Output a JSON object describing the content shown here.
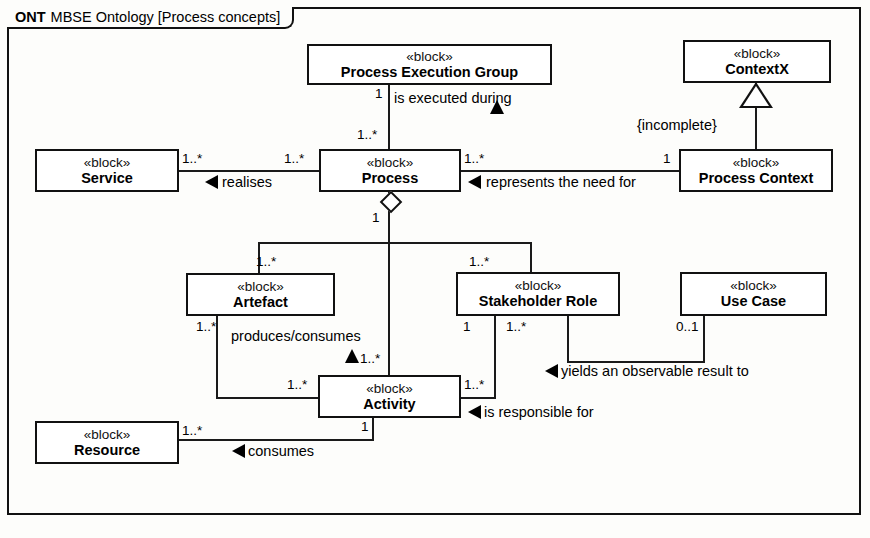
{
  "diagram": {
    "frame_kind": "ONT",
    "frame_title": "MBSE Ontology [Process concepts]",
    "stereotype": "«block»"
  },
  "blocks": [
    {
      "id": "process-execution-group",
      "stereotype": "«block»",
      "name": "Process Execution Group"
    },
    {
      "id": "contextx",
      "stereotype": "«block»",
      "name": "ContextX"
    },
    {
      "id": "service",
      "stereotype": "«block»",
      "name": "Service"
    },
    {
      "id": "process",
      "stereotype": "«block»",
      "name": "Process"
    },
    {
      "id": "process-context",
      "stereotype": "«block»",
      "name": "Process Context"
    },
    {
      "id": "artefact",
      "stereotype": "«block»",
      "name": "Artefact"
    },
    {
      "id": "stakeholder-role",
      "stereotype": "«block»",
      "name": "Stakeholder Role"
    },
    {
      "id": "use-case",
      "stereotype": "«block»",
      "name": "Use Case"
    },
    {
      "id": "activity",
      "stereotype": "«block»",
      "name": "Activity"
    },
    {
      "id": "resource",
      "stereotype": "«block»",
      "name": "Resource"
    }
  ],
  "associations": [
    {
      "id": "is-executed-during",
      "label": "is executed during",
      "source": "Process Execution Group",
      "target": "Process",
      "source_mult": "1",
      "target_mult": "1..*"
    },
    {
      "id": "realises",
      "label": "realises",
      "source": "Process",
      "target": "Service",
      "source_mult": "1..*",
      "target_mult": "1..*"
    },
    {
      "id": "represents-the-need-for",
      "label": "represents the need for",
      "source": "Process Context",
      "target": "Process",
      "source_mult": "1",
      "target_mult": "1..*"
    },
    {
      "id": "produces-consumes",
      "label": "produces/consumes",
      "source": "Activity",
      "target": "Artefact",
      "source_mult": "1..*",
      "target_mult": "1..*"
    },
    {
      "id": "yields-observable-result",
      "label": "yields an observable result to",
      "source": "Use Case",
      "target": "Stakeholder Role",
      "source_mult": "0..1",
      "target_mult": "1..*"
    },
    {
      "id": "is-responsible-for",
      "label": "is responsible for",
      "source": "Stakeholder Role",
      "target": "Activity",
      "source_mult": "1",
      "target_mult": "1..*"
    },
    {
      "id": "consumes",
      "label": "consumes",
      "source": "Activity",
      "target": "Resource",
      "source_mult": "1",
      "target_mult": "1..*"
    }
  ],
  "generalization": {
    "id": "process-context-to-contextx",
    "general": "ContextX",
    "specific": "Process Context",
    "constraint": "{incomplete}"
  },
  "aggregation": {
    "id": "process-composition",
    "whole": "Process",
    "whole_mult": "1",
    "parts": [
      {
        "part": "Artefact",
        "mult": "1..*"
      },
      {
        "part": "Activity",
        "mult": "1..*"
      },
      {
        "part": "Stakeholder Role",
        "mult": "1..*"
      }
    ]
  },
  "multiplicities": {
    "peg_bottom": "1",
    "process_top": "1..*",
    "service_right": "1..*",
    "process_left": "1..*",
    "process_right": "1..*",
    "process_context_left": "1",
    "process_agg_1": "1",
    "artefact_top": "1..*",
    "stakeholder_top": "1..*",
    "artefact_bottom_left": "1..*",
    "activity_produces_mult": "1..*",
    "activity_left": "1..*",
    "activity_right": "1..*",
    "activity_bottom": "1",
    "stakeholder_bottom_left": "1",
    "stakeholder_bottom_right": "1..*",
    "usecase_bottom": "0..1",
    "resource_right": "1..*"
  }
}
